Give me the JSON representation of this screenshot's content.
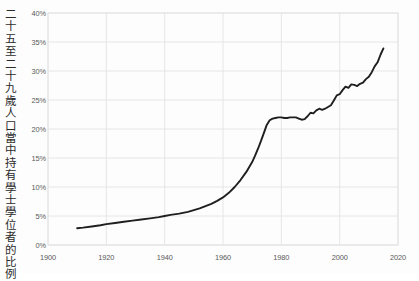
{
  "chart_data": {
    "type": "line",
    "title": "",
    "xlabel": "",
    "ylabel": "二十五至二十九歲人口當中持有學士學位者的比例",
    "xlim": [
      1900,
      2020
    ],
    "ylim": [
      0,
      40
    ],
    "grid": true,
    "legend": null,
    "line_color": "#1f1f1f",
    "grid_color": "#e3e3e3",
    "background_color": "#fdfdfd",
    "xticks": [
      "1900",
      "1920",
      "1940",
      "1960",
      "1980",
      "2000",
      "2020"
    ],
    "xtick_values": [
      1900,
      1920,
      1940,
      1960,
      1980,
      2000,
      2020
    ],
    "yticks": [
      "0%",
      "5%",
      "10%",
      "15%",
      "20%",
      "25%",
      "30%",
      "35%",
      "40%"
    ],
    "ytick_values": [
      0,
      5,
      10,
      15,
      20,
      25,
      30,
      35,
      40
    ],
    "series": [
      {
        "name": "學士學位持有比例",
        "x": [
          1910,
          1912,
          1915,
          1918,
          1920,
          1923,
          1926,
          1929,
          1932,
          1935,
          1938,
          1940,
          1942,
          1945,
          1948,
          1950,
          1952,
          1954,
          1956,
          1958,
          1960,
          1962,
          1964,
          1966,
          1968,
          1970,
          1971,
          1972,
          1973,
          1974,
          1975,
          1976,
          1977,
          1978,
          1979,
          1980,
          1981,
          1982,
          1983,
          1984,
          1985,
          1986,
          1987,
          1988,
          1989,
          1990,
          1991,
          1992,
          1993,
          1994,
          1995,
          1996,
          1997,
          1998,
          1999,
          2000,
          2001,
          2002,
          2003,
          2004,
          2005,
          2006,
          2007,
          2008,
          2009,
          2010,
          2011,
          2012,
          2013,
          2014,
          2015
        ],
        "values": [
          2.9,
          3.0,
          3.2,
          3.4,
          3.6,
          3.8,
          4.0,
          4.2,
          4.4,
          4.6,
          4.8,
          5.0,
          5.2,
          5.4,
          5.7,
          6.0,
          6.3,
          6.7,
          7.1,
          7.6,
          8.2,
          9.0,
          10.0,
          11.2,
          12.6,
          14.3,
          15.4,
          16.6,
          17.9,
          19.3,
          20.7,
          21.5,
          21.8,
          21.9,
          22.0,
          22.0,
          21.9,
          21.9,
          22.0,
          22.0,
          22.0,
          21.8,
          21.6,
          21.7,
          22.2,
          22.8,
          22.7,
          23.2,
          23.5,
          23.3,
          23.5,
          23.8,
          24.1,
          24.9,
          25.8,
          26.0,
          26.7,
          27.3,
          27.1,
          27.7,
          27.6,
          27.4,
          27.8,
          28.0,
          28.6,
          29.0,
          29.8,
          30.8,
          31.5,
          32.8,
          33.9
        ]
      }
    ]
  },
  "axis": {
    "y_axis_caption": "二十五至二十九歲人口當中持有學士學位者的比例"
  }
}
